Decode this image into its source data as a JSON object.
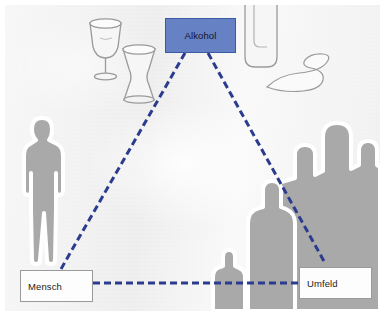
{
  "figure": {
    "kind": "triangle-relationship-diagram",
    "background_color": "#eeefee",
    "panel_border_color": "#ffffff"
  },
  "nodes": {
    "top": {
      "label": "Alkohol",
      "fill_color": "#6681c4",
      "border_color": "#3b5aa6",
      "text_color": "#12152b"
    },
    "bottom_left": {
      "label": "Mensch",
      "fill_color": "#fdfdfd",
      "border_color": "#9a9a9a",
      "text_color": "#1b1b1b"
    },
    "bottom_right": {
      "label": "Umfeld",
      "fill_color": "#fdfdfd",
      "border_color": "#9a9a9a",
      "text_color": "#1b1b1b"
    }
  },
  "connectors": {
    "style": "dashed",
    "color": "#2b3c8e",
    "width_px": 3,
    "dash": "7 4",
    "edges": [
      {
        "name": "alkohol-mensch",
        "from": "Alkohol",
        "to": "Mensch"
      },
      {
        "name": "alkohol-umfeld",
        "from": "Alkohol",
        "to": "Umfeld"
      },
      {
        "name": "mensch-umfeld",
        "from": "Mensch",
        "to": "Umfeld"
      }
    ]
  },
  "artwork": {
    "silhouette_fill": "#a9a9a9",
    "silhouette_outline": "#ffffff",
    "glass_outline": "#9a9a9a",
    "glass_fill": "#f6f6f6",
    "items": [
      {
        "name": "wine-glass",
        "kind": "glassware"
      },
      {
        "name": "tumbler-glass",
        "kind": "glassware"
      },
      {
        "name": "tall-bottle",
        "kind": "glassware"
      },
      {
        "name": "spill-squiggle",
        "kind": "liquid-spill"
      },
      {
        "name": "person-silhouette-left",
        "kind": "person",
        "count": 1
      },
      {
        "name": "crowd-silhouettes-right",
        "kind": "person-group",
        "count": 5
      }
    ]
  }
}
